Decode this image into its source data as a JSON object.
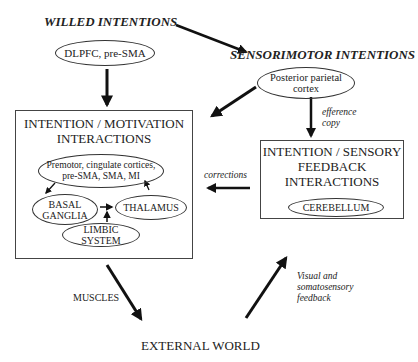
{
  "diagram": {
    "headers": {
      "willed": "WILLED INTENTIONS",
      "sensorimotor": "SENSORIMOTOR INTENTIONS"
    },
    "nodes": {
      "dlpfc": "DLPFC, pre-SMA",
      "ppc_line1": "Posterior parietal",
      "ppc_line2": "cortex",
      "premotor_line1": "Premotor, cingulate cortices,",
      "premotor_line2": "pre-SMA, SMA, MI",
      "basal_line1": "BASAL",
      "basal_line2": "GANGLIA",
      "thalamus": "THALAMUS",
      "limbic": "LIMBIC SYSTEM",
      "cerebellum": "CEREBELLUM",
      "external_world": "EXTERNAL WORLD"
    },
    "boxes": {
      "motivation_line1": "INTENTION / MOTIVATION",
      "motivation_line2": "INTERACTIONS",
      "sensory_line1": "INTENTION / SENSORY",
      "sensory_line2": "FEEDBACK",
      "sensory_line3": "INTERACTIONS"
    },
    "edge_labels": {
      "efference_line1": "efference",
      "efference_line2": "copy",
      "corrections": "corrections",
      "muscles": "MUSCLES",
      "feedback_line1": "Visual and",
      "feedback_line2": "somatosensory",
      "feedback_line3": "feedback"
    }
  }
}
